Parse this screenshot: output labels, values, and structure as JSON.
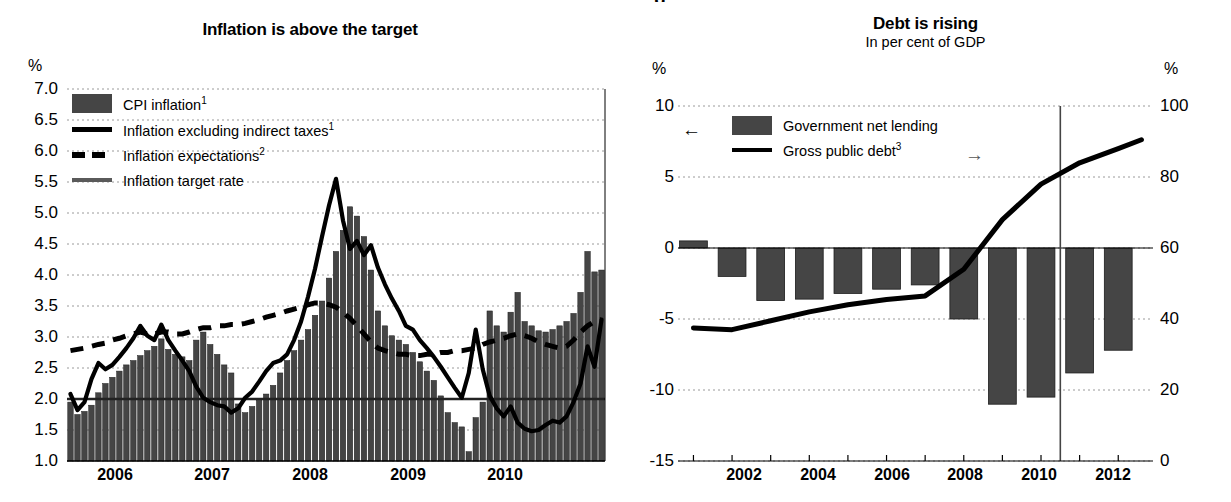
{
  "cut_title_fragment": "g",
  "left": {
    "title": "Inflation is above the target",
    "y_unit": "%",
    "y_ticks": [
      "7.0",
      "6.5",
      "6.0",
      "5.5",
      "5.0",
      "4.5",
      "4.0",
      "3.5",
      "3.0",
      "2.5",
      "2.0",
      "1.5",
      "1.0"
    ],
    "x_ticks": [
      "2006",
      "2007",
      "2008",
      "2009",
      "2010"
    ],
    "legend": [
      {
        "label": "CPI inflation",
        "sup": "1",
        "marker": "bar-swatch"
      },
      {
        "label": "Inflation excluding indirect taxes",
        "sup": "1",
        "marker": "solid-line-swatch"
      },
      {
        "label": "Inflation expectations",
        "sup": "2",
        "marker": "dashed-line-swatch"
      },
      {
        "label": "Inflation target rate",
        "sup": "",
        "marker": "gray-line-swatch"
      }
    ]
  },
  "right": {
    "title": "Debt is rising",
    "subtitle": "In per cent of GDP",
    "y_unit_left": "%",
    "y_unit_right": "%",
    "y_ticks_left": [
      "10",
      "5",
      "0",
      "-5",
      "-10",
      "-15"
    ],
    "y_ticks_right": [
      "100",
      "80",
      "60",
      "40",
      "20",
      "0"
    ],
    "x_ticks": [
      "2002",
      "2004",
      "2006",
      "2008",
      "2010",
      "2012"
    ],
    "legend": [
      {
        "label": "Government net lending",
        "sup": "",
        "marker": "bar-swatch",
        "arrow": "←"
      },
      {
        "label": "Gross public debt",
        "sup": "3",
        "marker": "solid-line-swatch",
        "arrow": "→"
      }
    ]
  },
  "chart_data": [
    {
      "type": "bar",
      "title": "Inflation is above the target",
      "xlabel": "",
      "ylabel": "%",
      "ylim": [
        1.0,
        7.0
      ],
      "grid": true,
      "legend_position": "top-left",
      "x_tick_labels": [
        "2006",
        "2007",
        "2008",
        "2009",
        "2010"
      ],
      "x_start": "2005-07",
      "x_end": "2010-12",
      "series": [
        {
          "name": "CPI inflation",
          "type": "bar",
          "values": [
            1.95,
            1.75,
            1.8,
            1.9,
            2.1,
            2.25,
            2.35,
            2.45,
            2.55,
            2.62,
            2.7,
            2.78,
            2.85,
            2.97,
            2.8,
            2.72,
            2.68,
            2.62,
            2.95,
            3.08,
            2.88,
            2.72,
            2.55,
            2.42,
            1.92,
            1.78,
            1.88,
            1.98,
            2.08,
            2.22,
            2.42,
            2.62,
            2.78,
            2.95,
            3.12,
            3.35,
            3.58,
            3.95,
            4.38,
            4.72,
            5.1,
            4.95,
            4.62,
            4.08,
            3.42,
            3.18,
            3.02,
            2.95,
            2.88,
            2.75,
            2.6,
            2.45,
            2.3,
            2.05,
            1.78,
            1.62,
            1.55,
            1.15,
            1.7,
            1.95,
            3.42,
            3.18,
            3.08,
            3.4,
            3.72,
            3.25,
            3.18,
            3.1,
            3.08,
            3.12,
            3.18,
            3.25,
            3.38,
            3.72,
            4.38,
            4.05,
            4.08
          ]
        },
        {
          "name": "Inflation excluding indirect taxes",
          "type": "line",
          "values": [
            2.08,
            1.82,
            1.95,
            2.32,
            2.58,
            2.48,
            2.55,
            2.68,
            2.82,
            2.98,
            3.18,
            3.02,
            2.95,
            3.2,
            2.95,
            2.78,
            2.62,
            2.45,
            2.2,
            2.02,
            1.95,
            1.9,
            1.88,
            1.78,
            1.85,
            2.02,
            2.12,
            2.28,
            2.45,
            2.58,
            2.62,
            2.72,
            2.95,
            3.25,
            3.65,
            4.1,
            4.62,
            5.12,
            5.55,
            4.88,
            4.42,
            4.55,
            4.32,
            4.48,
            4.12,
            3.85,
            3.62,
            3.42,
            3.18,
            3.12,
            2.95,
            2.82,
            2.68,
            2.52,
            2.35,
            2.18,
            2.02,
            2.42,
            3.12,
            2.48,
            2.05,
            1.85,
            1.72,
            1.88,
            1.62,
            1.52,
            1.48,
            1.5,
            1.58,
            1.65,
            1.62,
            1.72,
            1.95,
            2.25,
            2.85,
            2.52,
            3.28
          ]
        },
        {
          "name": "Inflation expectations",
          "type": "dashed-line",
          "values": [
            2.78,
            2.8,
            2.82,
            2.85,
            2.88,
            2.9,
            2.95,
            2.98,
            3.02,
            3.05,
            3.08,
            3.05,
            3.05,
            3.08,
            3.08,
            3.05,
            3.05,
            3.08,
            3.12,
            3.15,
            3.15,
            3.18,
            3.18,
            3.2,
            3.2,
            3.22,
            3.25,
            3.28,
            3.32,
            3.35,
            3.38,
            3.42,
            3.45,
            3.48,
            3.52,
            3.55,
            3.55,
            3.52,
            3.48,
            3.4,
            3.3,
            3.18,
            3.05,
            2.92,
            2.82,
            2.78,
            2.75,
            2.72,
            2.72,
            2.7,
            2.7,
            2.72,
            2.72,
            2.75,
            2.75,
            2.78,
            2.78,
            2.8,
            2.82,
            2.88,
            2.92,
            2.95,
            2.98,
            3.02,
            3.05,
            3.02,
            2.98,
            2.92,
            2.88,
            2.85,
            2.82,
            2.85,
            2.95,
            3.08,
            3.18,
            3.25,
            3.28
          ]
        },
        {
          "name": "Inflation target rate",
          "type": "constant-line",
          "value": 2.0
        }
      ]
    },
    {
      "type": "bar",
      "title": "Debt is rising",
      "subtitle": "In per cent of GDP",
      "xlabel": "",
      "ylabel_left": "%",
      "ylabel_right": "%",
      "ylim_left": [
        -15,
        10
      ],
      "ylim_right": [
        0,
        100
      ],
      "grid": true,
      "legend_position": "top-left",
      "forecast_divider_x": "2010.5",
      "categories": [
        2001,
        2002,
        2003,
        2004,
        2005,
        2006,
        2007,
        2008,
        2009,
        2010,
        2011,
        2012
      ],
      "x_tick_labels": [
        "2002",
        "2004",
        "2006",
        "2008",
        "2010",
        "2012"
      ],
      "series": [
        {
          "name": "Government net lending",
          "type": "bar",
          "axis": "left",
          "values": [
            0.5,
            -2.0,
            -3.7,
            -3.6,
            -3.2,
            -2.9,
            -2.6,
            -5.0,
            -11.0,
            -10.5,
            -8.8,
            -7.2
          ]
        },
        {
          "name": "Gross public debt",
          "type": "line",
          "axis": "right",
          "values": [
            37.5,
            37.0,
            39.5,
            42.0,
            44.0,
            45.5,
            46.5,
            54.0,
            68.0,
            78.0,
            84.0,
            88.0,
            90.5
          ],
          "x": [
            2001,
            2002,
            2003,
            2004,
            2005,
            2006,
            2007,
            2008,
            2009,
            2010,
            2011,
            2012,
            2012.6
          ]
        }
      ]
    }
  ]
}
